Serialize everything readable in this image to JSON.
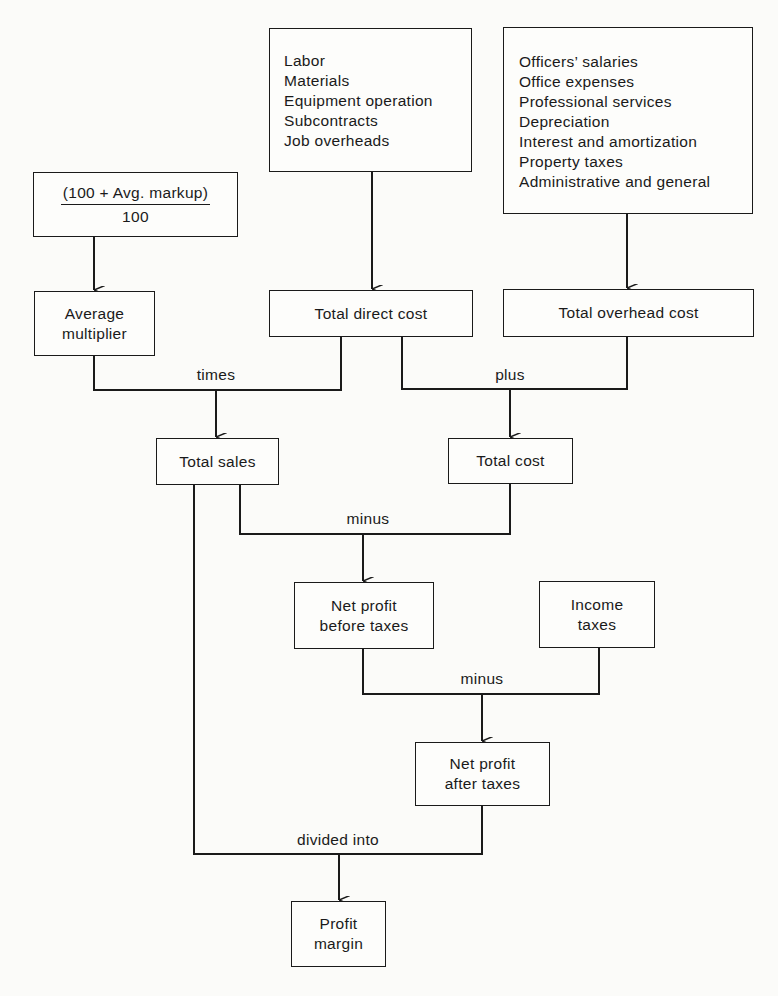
{
  "diagram": {
    "title": "",
    "nodes": {
      "markup_fraction": {
        "numerator": "(100 + Avg. markup)",
        "denominator": "100"
      },
      "direct_cost_items": {
        "items": [
          "Labor",
          "Materials",
          "Equipment operation",
          "Subcontracts",
          "Job overheads"
        ]
      },
      "overhead_items": {
        "items": [
          "Officers’ salaries",
          "Office expenses",
          "Professional services",
          "Depreciation",
          "Interest and amortization",
          "Property taxes",
          "Administrative and general"
        ]
      },
      "average_multiplier": {
        "line1": "Average",
        "line2": "multiplier"
      },
      "total_direct_cost": {
        "label": "Total direct cost"
      },
      "total_overhead_cost": {
        "label": "Total overhead cost"
      },
      "total_sales": {
        "label": "Total sales"
      },
      "total_cost": {
        "label": "Total cost"
      },
      "net_profit_before_taxes": {
        "line1": "Net profit",
        "line2": "before taxes"
      },
      "income_taxes": {
        "line1": "Income",
        "line2": "taxes"
      },
      "net_profit_after_taxes": {
        "line1": "Net profit",
        "line2": "after taxes"
      },
      "profit_margin": {
        "line1": "Profit",
        "line2": "margin"
      }
    },
    "operators": {
      "times": "times",
      "plus": "plus",
      "minus_1": "minus",
      "minus_2": "minus",
      "divided_into": "divided into"
    },
    "edges": [
      {
        "from": "markup_fraction",
        "to": "average_multiplier"
      },
      {
        "from": "direct_cost_items",
        "to": "total_direct_cost"
      },
      {
        "from": "overhead_items",
        "to": "total_overhead_cost"
      },
      {
        "from": [
          "average_multiplier",
          "total_direct_cost"
        ],
        "op": "times",
        "to": "total_sales"
      },
      {
        "from": [
          "total_direct_cost",
          "total_overhead_cost"
        ],
        "op": "plus",
        "to": "total_cost"
      },
      {
        "from": [
          "total_sales",
          "total_cost"
        ],
        "op": "minus",
        "to": "net_profit_before_taxes"
      },
      {
        "from": [
          "net_profit_before_taxes",
          "income_taxes"
        ],
        "op": "minus",
        "to": "net_profit_after_taxes"
      },
      {
        "from": [
          "total_sales",
          "net_profit_after_taxes"
        ],
        "op": "divided into",
        "to": "profit_margin"
      }
    ],
    "colors": {
      "line": "#1a1a1a",
      "background": "#fbfbf9"
    }
  }
}
